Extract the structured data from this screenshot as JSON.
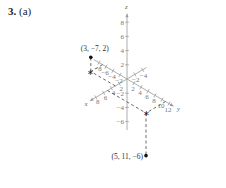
{
  "problem": {
    "number": "3.",
    "part": "(a)"
  },
  "axes": {
    "x_label": "x",
    "y_label": "y",
    "z_label": "z",
    "x_ticks": [
      -4,
      -2,
      2,
      4,
      6,
      8
    ],
    "y_ticks": [
      -8,
      -6,
      -4,
      -2,
      2,
      4,
      6,
      8,
      10,
      12
    ],
    "z_ticks": [
      -6,
      -4,
      -2,
      2,
      4,
      6,
      8
    ]
  },
  "points": [
    {
      "label": "(3, −7, 2)",
      "coords": [
        3,
        -7,
        2
      ]
    },
    {
      "label": "(5, 11, −6)",
      "coords": [
        5,
        11,
        -6
      ]
    }
  ],
  "projection_marker": "star"
}
